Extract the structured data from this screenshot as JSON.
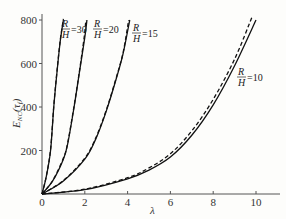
{
  "chart_data": {
    "type": "line",
    "title": "",
    "xlabel": "λ",
    "ylabel": "E_NC(τ_f)",
    "xlim": [
      0,
      11
    ],
    "ylim": [
      0,
      820
    ],
    "x_ticks": [
      0,
      2,
      4,
      6,
      8,
      10
    ],
    "y_ticks": [
      200,
      400,
      600,
      800
    ],
    "x_tick_labels": [
      "0",
      "2",
      "4",
      "6",
      "8",
      "10"
    ],
    "y_tick_labels": [
      "200",
      "400",
      "600",
      "800"
    ],
    "grid": false,
    "legend": "inline labels",
    "series": [
      {
        "name": "R/H=30 (solid)",
        "style": "solid",
        "x": [
          0,
          0.2,
          0.4,
          0.55,
          0.7,
          0.85,
          1.0
        ],
        "y": [
          0,
          80,
          200,
          400,
          560,
          700,
          800
        ]
      },
      {
        "name": "R/H=30 (dashed)",
        "style": "dashed",
        "x": [
          0,
          0.2,
          0.4,
          0.55,
          0.7,
          0.85,
          1.0
        ],
        "y": [
          0,
          82,
          205,
          405,
          565,
          705,
          805
        ]
      },
      {
        "name": "R/H=20 (solid)",
        "style": "solid",
        "x": [
          0,
          0.5,
          1.0,
          1.2,
          1.5,
          1.75,
          2.0,
          2.1
        ],
        "y": [
          0,
          60,
          160,
          230,
          400,
          560,
          720,
          800
        ]
      },
      {
        "name": "R/H=20 (dashed)",
        "style": "dashed",
        "x": [
          0,
          0.5,
          1.0,
          1.2,
          1.5,
          1.75,
          1.97,
          2.05
        ],
        "y": [
          0,
          62,
          165,
          235,
          405,
          565,
          720,
          800
        ]
      },
      {
        "name": "R/H=15 (solid)",
        "style": "solid",
        "x": [
          0,
          1.0,
          2.0,
          2.5,
          3.0,
          3.5,
          3.8,
          4.1
        ],
        "y": [
          0,
          60,
          160,
          250,
          380,
          540,
          650,
          800
        ]
      },
      {
        "name": "R/H=15 (dashed)",
        "style": "dashed",
        "x": [
          0,
          1.0,
          2.0,
          2.5,
          3.0,
          3.5,
          3.8,
          4.05
        ],
        "y": [
          0,
          62,
          165,
          255,
          385,
          545,
          655,
          800
        ]
      },
      {
        "name": "R/H=10 (solid)",
        "style": "solid",
        "x": [
          0,
          2,
          4,
          5,
          6,
          7,
          8,
          9,
          10
        ],
        "y": [
          0,
          20,
          70,
          110,
          170,
          270,
          410,
          590,
          800
        ]
      },
      {
        "name": "R/H=10 (dashed)",
        "style": "dashed",
        "x": [
          0,
          2,
          4,
          5,
          6,
          7,
          8,
          9,
          9.8
        ],
        "y": [
          0,
          22,
          75,
          120,
          185,
          290,
          435,
          620,
          810
        ]
      }
    ],
    "annotations": [
      {
        "text": "R/H=30",
        "x": 1.1,
        "y": 780
      },
      {
        "text": "R/H=20",
        "x": 2.2,
        "y": 780
      },
      {
        "text": "R/H=15",
        "x": 4.3,
        "y": 760
      },
      {
        "text": "R/H=10",
        "x": 9.2,
        "y": 540
      }
    ]
  },
  "labels": {
    "xlabel": "λ",
    "ylabel_main": "E",
    "ylabel_sub": "NC",
    "ylabel_arg": "(τ",
    "ylabel_arg_sub": "f",
    "ylabel_close": ")",
    "R": "R",
    "H": "H",
    "eq30": "=30",
    "eq20": "=20",
    "eq15": "=15",
    "eq10": "=10"
  }
}
